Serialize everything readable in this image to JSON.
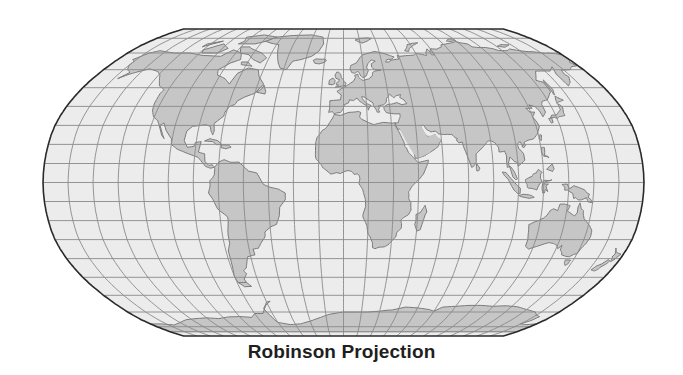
{
  "title": "Robinson Projection",
  "map": {
    "projection": "Robinson",
    "graticule": {
      "meridian_step_deg": 15,
      "parallel_step_deg": 10
    },
    "colors": {
      "ocean": "#ececec",
      "land": "#c6c6c6",
      "coastline": "#7a7a7a",
      "graticule": "#8a8a8a",
      "outline": "#2a2a2a",
      "title": "#1f1f1f"
    },
    "frame": {
      "cx": 343.5,
      "cy": 182.5,
      "half_width": 300.5,
      "half_height": 153.5
    }
  }
}
